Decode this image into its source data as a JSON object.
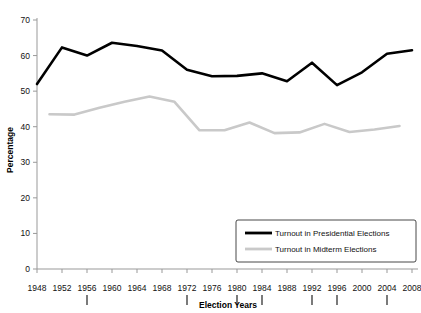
{
  "chart_data": {
    "type": "line",
    "title": "",
    "xlabel": "Election Years",
    "ylabel": "Percentage",
    "xlim": [
      1948,
      2008
    ],
    "ylim": [
      0,
      70
    ],
    "ytick_step": 10,
    "xtick_step": 4,
    "grid": false,
    "legend_position": "bottom-right",
    "yticks": [
      "0",
      "10",
      "20",
      "30",
      "40",
      "50",
      "60",
      "70"
    ],
    "xticks": [
      "1948",
      "1952",
      "1956",
      "1960",
      "1964",
      "1968",
      "1972",
      "1976",
      "1980",
      "1984",
      "1988",
      "1992",
      "1996",
      "2000",
      "2004",
      "2008"
    ],
    "marked_years": [
      "1956",
      "1972",
      "1980",
      "1984",
      "1992",
      "1996",
      "2004"
    ],
    "series": [
      {
        "name": "Turnout in Presidential Elections",
        "color": "#000000",
        "width": 2.6,
        "x": [
          1948,
          1952,
          1956,
          1960,
          1964,
          1968,
          1972,
          1976,
          1980,
          1984,
          1988,
          1992,
          1996,
          2000,
          2004,
          2008
        ],
        "values": [
          52.0,
          62.3,
          60.0,
          63.6,
          62.7,
          61.4,
          56.0,
          54.2,
          54.3,
          55.0,
          52.8,
          58.0,
          51.7,
          55.3,
          60.5,
          61.5
        ]
      },
      {
        "name": "Turnout in Midterm Elections",
        "color": "#c9c9c9",
        "width": 2.6,
        "x": [
          1950,
          1954,
          1958,
          1962,
          1966,
          1970,
          1974,
          1978,
          1982,
          1986,
          1990,
          1994,
          1998,
          2002,
          2006
        ],
        "values": [
          43.5,
          43.4,
          45.3,
          47.0,
          48.5,
          47.0,
          39.0,
          39.0,
          41.2,
          38.2,
          38.4,
          40.8,
          38.5,
          39.2,
          40.2
        ]
      }
    ]
  },
  "legend": {
    "items": [
      {
        "label": "Turnout in Presidential Elections",
        "color": "#000000"
      },
      {
        "label": "Turnout in Midterm Elections",
        "color": "#c9c9c9"
      }
    ]
  }
}
